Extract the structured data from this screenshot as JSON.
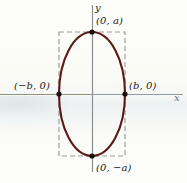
{
  "figure": {
    "kind": "ellipse-coordinate-diagram",
    "background_color": "#fbfbf7"
  },
  "axes": {
    "x_label": "x",
    "y_label": "y",
    "x_axis_color_left": "#8d9479",
    "x_axis_color_right": "#8f9aa3",
    "y_axis_color": "#8c8f92",
    "x_label_color": "#6f6a92",
    "origin": {
      "x": 92,
      "y": 94
    },
    "x_range_px": [
      0,
      183
    ],
    "y_range_px": [
      5,
      172
    ]
  },
  "curve": {
    "type": "ellipse",
    "stroke_color": "#5a1a18",
    "stroke_width": 2.1,
    "center": {
      "x": 92,
      "y": 94
    },
    "semi_axis_x_px": 33,
    "semi_axis_y_px": 62,
    "semi_axis_x_symbol": "b",
    "semi_axis_y_symbol": "a"
  },
  "bounding_box": {
    "style": "dashed",
    "stroke_color": "#9a9a96",
    "left": 59,
    "top": 32,
    "right": 125,
    "bottom": 156,
    "dash_pattern": "5,3"
  },
  "points": [
    {
      "name": "top-vertex",
      "label": "(0, a)",
      "cx": 92,
      "cy": 32
    },
    {
      "name": "right-vertex",
      "label": "(b, 0)",
      "cx": 125,
      "cy": 94
    },
    {
      "name": "bottom-vertex",
      "label": "(0, −a)",
      "cx": 92,
      "cy": 156
    },
    {
      "name": "left-vertex",
      "label": "(−b, 0)",
      "cx": 59,
      "cy": 94
    }
  ],
  "point_marker": {
    "fill_color": "#17120f",
    "radius": 2.6
  }
}
